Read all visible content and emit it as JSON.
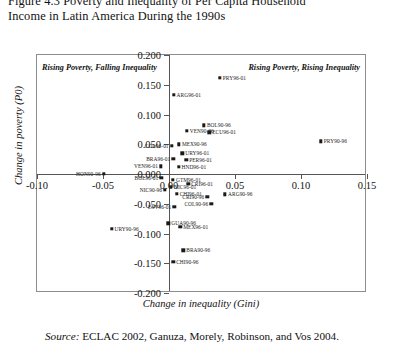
{
  "title": {
    "line1": "Figure 4.3 Poverty and Inequality of Per Capita Household",
    "line2": "Income in Latin America During the 1990s"
  },
  "source": {
    "keyword": "Source:",
    "text": " ECLAC 2002, Ganuza, Morely, Robinson, and Vos 2004."
  },
  "annotations": {
    "top_left": "Rising Poverty, Falling Inequality",
    "top_right": "Rising Poverty, Rising Inequality"
  },
  "chart_data": {
    "type": "scatter",
    "title": "Figure 4.3 Poverty and Inequality of Per Capita Household Income in Latin America During the 1990s",
    "xlabel": "Change in inequality (Gini)",
    "ylabel": "Change in poverty (P0)",
    "xlim": [
      -0.1,
      0.15
    ],
    "ylim": [
      -0.2,
      0.2
    ],
    "xticks": [
      "-0.10",
      "-0.05",
      "0.00",
      "0.05",
      "0.10",
      "0.15"
    ],
    "xtick_values": [
      -0.1,
      -0.05,
      0.0,
      0.05,
      0.1,
      0.15
    ],
    "yticks": [
      "0.200",
      "0.150",
      "0.100",
      "0.050",
      "0.000",
      "-0.050",
      "-0.100",
      "-0.150",
      "-0.200"
    ],
    "ytick_values": [
      0.2,
      0.15,
      0.1,
      0.05,
      0.0,
      -0.05,
      -0.1,
      -0.15,
      -0.2
    ],
    "grid": false,
    "legend": "none",
    "marker": "square",
    "marker_color": "#1a1a1a",
    "points": [
      {
        "label": "ARG96-01",
        "x": 0.0035,
        "y": 0.133,
        "side": "right"
      },
      {
        "label": "PRY96-01",
        "x": 0.0385,
        "y": 0.162,
        "side": "right"
      },
      {
        "label": "BOL90-96",
        "x": 0.0265,
        "y": 0.082,
        "side": "right"
      },
      {
        "label": "VEN90-96",
        "x": 0.0135,
        "y": 0.073,
        "side": "right"
      },
      {
        "label": "ECU96-01",
        "x": 0.0305,
        "y": 0.07,
        "side": "right"
      },
      {
        "label": "PRY90-96",
        "x": 0.115,
        "y": 0.055,
        "side": "right"
      },
      {
        "label": "MEX90-96",
        "x": 0.0075,
        "y": 0.05,
        "side": "right"
      },
      {
        "label": "COL96-01",
        "x": 0.002,
        "y": 0.047,
        "side": "left"
      },
      {
        "label": "URY96-01",
        "x": 0.01,
        "y": 0.035,
        "side": "right"
      },
      {
        "label": "BRA96-01",
        "x": 0.0032,
        "y": 0.026,
        "side": "left"
      },
      {
        "label": "PER96-01",
        "x": 0.013,
        "y": 0.024,
        "side": "right"
      },
      {
        "label": "VEN96-01",
        "x": -0.006,
        "y": 0.013,
        "side": "left"
      },
      {
        "label": "HND96-01",
        "x": 0.0072,
        "y": 0.012,
        "side": "right"
      },
      {
        "label": "HON90-96",
        "x": -0.0495,
        "y": 0.0,
        "side": "left"
      },
      {
        "label": "BOL96-01",
        "x": -0.0058,
        "y": -0.006,
        "side": "left"
      },
      {
        "label": "GTM96-01",
        "x": 0.003,
        "y": -0.01,
        "side": "right"
      },
      {
        "label": "CRI96-01",
        "x": 0.0145,
        "y": -0.016,
        "side": "right"
      },
      {
        "label": "NIC90-96",
        "x": -0.003,
        "y": -0.027,
        "side": "left"
      },
      {
        "label": "NIC96-01",
        "x": 0.0015,
        "y": -0.022,
        "side": "right"
      },
      {
        "label": "CHI96-01",
        "x": 0.0058,
        "y": -0.033,
        "side": "right"
      },
      {
        "label": "CRI90-96",
        "x": 0.029,
        "y": -0.038,
        "side": "left"
      },
      {
        "label": "ARG90-96",
        "x": 0.0425,
        "y": -0.034,
        "side": "right"
      },
      {
        "label": "COL90-96",
        "x": 0.032,
        "y": -0.05,
        "side": "left"
      },
      {
        "label": "ESV96-01",
        "x": 0.004,
        "y": -0.055,
        "side": "left"
      },
      {
        "label": "GUA90-96",
        "x": -0.0005,
        "y": -0.083,
        "side": "right"
      },
      {
        "label": "MEX96-01",
        "x": 0.0085,
        "y": -0.089,
        "side": "right"
      },
      {
        "label": "URY90-96",
        "x": -0.0435,
        "y": -0.092,
        "side": "right"
      },
      {
        "label": "BRA90-96",
        "x": 0.0108,
        "y": -0.128,
        "side": "right"
      },
      {
        "label": "CHI90-96",
        "x": 0.0032,
        "y": -0.148,
        "side": "right"
      }
    ]
  }
}
